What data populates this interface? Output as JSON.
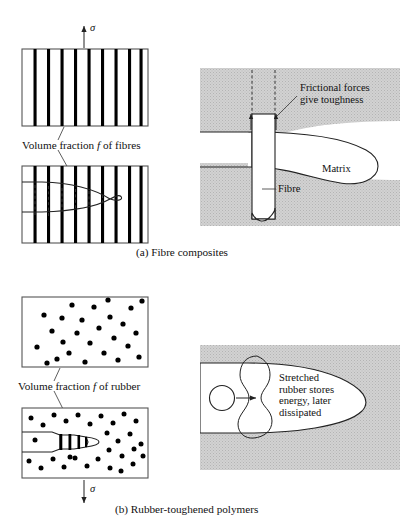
{
  "figure": {
    "background_color": "#ffffff",
    "ink_color": "#111111",
    "matrix_fill_color": "#cccccc",
    "crack_fill_color": "#ffffff",
    "fibre_color": "#000000",
    "particle_color": "#000000"
  },
  "panel_a": {
    "caption": "(a)  Fibre composites",
    "stress_symbol_top": "σ",
    "stress_arrow_top_direction": "up",
    "volume_fraction_label": {
      "prefix": "Volume fraction ",
      "symbol": "f",
      "suffix": " of fibres"
    },
    "specimen_top": {
      "name": "unloaded fibre composite",
      "fibre_count": 9
    },
    "specimen_bottom": {
      "name": "cracked fibre composite",
      "fibre_count": 9,
      "crack_description": "crack opening from left edge with fibres bridging"
    },
    "detail": {
      "matrix_label": "Matrix",
      "fibre_label": "Fibre",
      "annotation": {
        "line1": "Frictional forces",
        "line2": "give toughness"
      }
    }
  },
  "panel_b": {
    "caption": "(b)  Rubber-toughened polymers",
    "stress_symbol_bottom": "σ",
    "stress_arrow_bottom_direction": "down",
    "volume_fraction_label": {
      "prefix": "Volume fraction ",
      "symbol": "f",
      "suffix": " of rubber"
    },
    "specimen_top": {
      "name": "unloaded rubber-toughened polymer",
      "particle_count": 26
    },
    "specimen_bottom": {
      "name": "cracked rubber-toughened polymer",
      "particle_count": 30,
      "crack_description": "crack from left edge with stretched rubber ligaments bridging"
    },
    "detail": {
      "annotation": {
        "line1": "Stretched",
        "line2": "rubber stores",
        "line3": "energy, later",
        "line4": "dissipated"
      },
      "undeformed_particle_name": "undeformed rubber particle"
    }
  }
}
